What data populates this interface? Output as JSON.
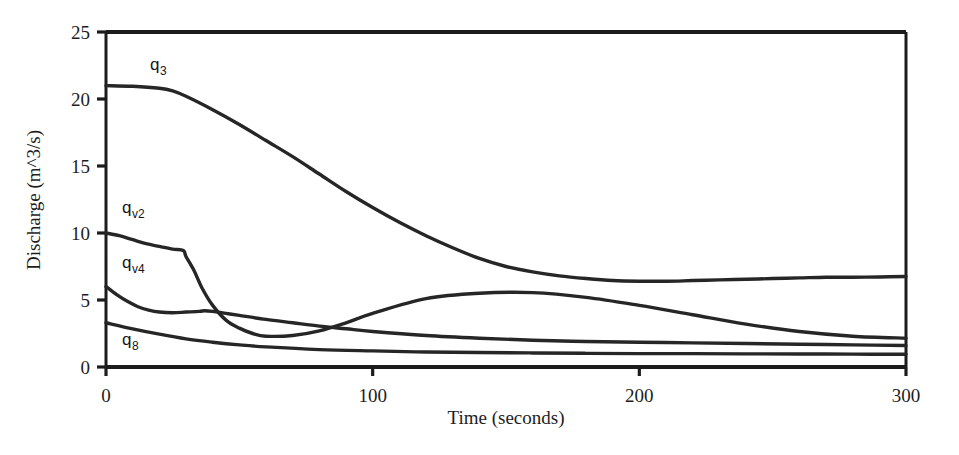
{
  "chart_data": {
    "type": "line",
    "title": "",
    "xlabel": "Time (seconds)",
    "ylabel": "Discharge (m^3/s)",
    "xlim": [
      0,
      300
    ],
    "ylim": [
      0,
      25
    ],
    "xticks": [
      0,
      100,
      200,
      300
    ],
    "yticks": [
      0,
      5,
      10,
      15,
      20,
      25
    ],
    "xtick_labels": [
      "0",
      "100",
      "200",
      "300"
    ],
    "ytick_labels": [
      "0",
      "5",
      "10",
      "15",
      "20",
      "25"
    ],
    "grid": false,
    "legend": "inline-labels",
    "line_color": "#262626",
    "background": "#ffffff",
    "frame": "box",
    "series": [
      {
        "name": "q3",
        "label": "q",
        "label_sub": "3",
        "label_x": 150,
        "label_y": 70,
        "x": [
          0,
          10,
          20,
          25,
          30,
          40,
          50,
          60,
          70,
          80,
          90,
          100,
          110,
          120,
          130,
          140,
          150,
          160,
          170,
          180,
          190,
          200,
          210,
          220,
          230,
          240,
          250,
          260,
          270,
          280,
          290,
          300
        ],
        "y": [
          21.0,
          20.95,
          20.8,
          20.6,
          20.2,
          19.2,
          18.1,
          16.9,
          15.7,
          14.4,
          13.1,
          11.9,
          10.8,
          9.8,
          8.9,
          8.1,
          7.5,
          7.1,
          6.8,
          6.6,
          6.45,
          6.4,
          6.4,
          6.45,
          6.5,
          6.55,
          6.6,
          6.65,
          6.7,
          6.7,
          6.72,
          6.75
        ]
      },
      {
        "name": "qv2",
        "label": "q",
        "label_sub": "v2",
        "label_x": 122,
        "label_y": 213,
        "x": [
          0,
          5,
          10,
          15,
          20,
          25,
          29,
          30,
          33,
          36,
          40,
          45,
          50,
          55,
          60,
          70,
          80,
          90,
          100,
          120,
          140,
          160,
          180,
          200,
          220,
          240,
          260,
          280,
          300
        ],
        "y": [
          10.0,
          9.8,
          9.5,
          9.2,
          9.0,
          8.8,
          8.7,
          8.25,
          7.2,
          5.9,
          4.6,
          3.5,
          2.9,
          2.5,
          2.3,
          2.35,
          2.7,
          3.3,
          4.0,
          5.1,
          5.5,
          5.55,
          5.2,
          4.6,
          3.9,
          3.2,
          2.65,
          2.3,
          2.15
        ]
      },
      {
        "name": "qv4",
        "label": "q",
        "label_sub": "v4",
        "label_x": 122,
        "label_y": 268,
        "x": [
          0,
          4,
          8,
          12,
          16,
          20,
          25,
          30,
          35,
          37,
          40,
          45,
          50,
          60,
          70,
          80,
          90,
          100,
          120,
          140,
          160,
          180,
          200,
          220,
          240,
          260,
          280,
          300
        ],
        "y": [
          6.0,
          5.4,
          4.9,
          4.5,
          4.25,
          4.1,
          4.05,
          4.1,
          4.15,
          4.2,
          4.15,
          4.0,
          3.85,
          3.55,
          3.3,
          3.05,
          2.85,
          2.65,
          2.35,
          2.15,
          2.0,
          1.9,
          1.85,
          1.8,
          1.75,
          1.7,
          1.65,
          1.6
        ]
      },
      {
        "name": "q8",
        "label": "q",
        "label_sub": "8",
        "label_x": 122,
        "label_y": 345,
        "x": [
          0,
          10,
          20,
          30,
          40,
          50,
          60,
          80,
          100,
          120,
          140,
          160,
          180,
          200,
          220,
          240,
          260,
          280,
          300
        ],
        "y": [
          3.3,
          2.85,
          2.45,
          2.1,
          1.85,
          1.65,
          1.5,
          1.3,
          1.2,
          1.12,
          1.08,
          1.05,
          1.02,
          1.0,
          1.0,
          0.98,
          0.97,
          0.96,
          0.95
        ]
      }
    ]
  },
  "geometry": {
    "plot_left": 106,
    "plot_right": 906,
    "plot_top": 32,
    "plot_bottom": 367
  },
  "axis": {
    "x_title": "Time (seconds)",
    "y_title": "Discharge (m^3/s)"
  }
}
